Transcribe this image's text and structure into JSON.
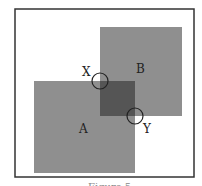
{
  "diagram": {
    "labels": {
      "square_a": "A",
      "square_b": "B",
      "point_x": "X",
      "point_y": "Y"
    },
    "caption": "Figure 5",
    "colors": {
      "frame": "#333333",
      "square_fill": "#8f8f8f",
      "overlap_fill": "#555555",
      "circle_stroke": "#222222",
      "background": "#ffffff"
    }
  }
}
